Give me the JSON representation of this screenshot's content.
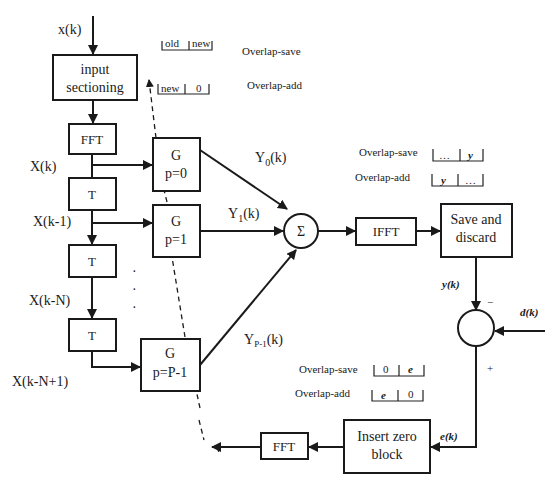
{
  "diagram": {
    "input_label": "x(k)",
    "blocks": {
      "input_sectioning": [
        "input",
        "sectioning"
      ],
      "fft_top": "FFT",
      "delay_1": "T",
      "delay_2": "T",
      "delay_3": "T",
      "g0": [
        "G",
        "p=0"
      ],
      "g1": [
        "G",
        "p=1"
      ],
      "gp": [
        "G",
        "p=P-1"
      ],
      "sum": "Σ",
      "ifft": "IFFT",
      "save_discard": [
        "Save and",
        "discard"
      ],
      "insert_zero": [
        "Insert zero",
        "block"
      ],
      "fft_bottom": "FFT"
    },
    "signals": {
      "xk": "X(k)",
      "xk1": "X(k-1)",
      "xkn": "X(k-N)",
      "xkn1": "X(k-N+1)",
      "y0": "Y",
      "y0_sub": "0",
      "y1": "Y",
      "y1_sub": "1",
      "yp": "Y",
      "yp_sub": "P-1",
      "k_suffix": "(k)",
      "yk": "y(k)",
      "dk": "d(k)",
      "ek": "e(k)",
      "minus": "−",
      "plus": "+",
      "ellipsis_dots": "·"
    },
    "annotations": {
      "input": {
        "overlap_save_label": "Overlap-save",
        "overlap_save_cells": [
          "old",
          "new"
        ],
        "overlap_add_label": "Overlap-add",
        "overlap_add_cells": [
          "new",
          "0"
        ]
      },
      "output": {
        "overlap_save_label": "Overlap-save",
        "overlap_save_cells": [
          "…",
          "y"
        ],
        "overlap_add_label": "Overlap-add",
        "overlap_add_cells": [
          "y",
          "…"
        ]
      },
      "error": {
        "overlap_save_label": "Overlap-save",
        "overlap_save_cells": [
          "0",
          "e"
        ],
        "overlap_add_label": "Overlap-add",
        "overlap_add_cells": [
          "e",
          "0"
        ]
      }
    }
  }
}
